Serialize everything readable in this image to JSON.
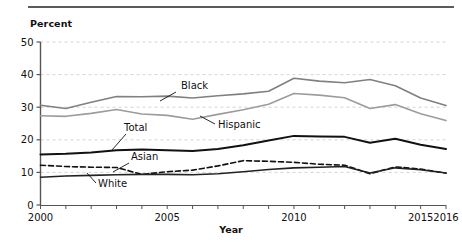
{
  "figure": {
    "y_axis_title": "Percent",
    "x_axis_title": "Year",
    "rule_color": "#5b5b5b"
  },
  "chart_data": {
    "type": "line",
    "title": "",
    "subtitle": "",
    "xlabel": "Year",
    "ylabel": "Percent",
    "xlim": [
      2000,
      2016
    ],
    "ylim": [
      0,
      50
    ],
    "ytick_labels": [
      "0",
      "10",
      "20",
      "30",
      "40",
      "50"
    ],
    "yticks": [
      0,
      10,
      20,
      30,
      40,
      50
    ],
    "xtick_labels": [
      "2000",
      "2005",
      "2010",
      "2015",
      "2016"
    ],
    "xticks": [
      2000,
      2005,
      2010,
      2015,
      2016
    ],
    "xtick_minor": [
      2001,
      2002,
      2003,
      2004,
      2006,
      2007,
      2008,
      2009,
      2011,
      2012,
      2013,
      2014
    ],
    "grid": "horizontal-dashed",
    "legend_position": "inline-annotations",
    "x": [
      2000,
      2001,
      2002,
      2003,
      2004,
      2005,
      2006,
      2007,
      2008,
      2009,
      2010,
      2011,
      2012,
      2013,
      2014,
      2015,
      2016
    ],
    "series": [
      {
        "name": "Black",
        "color": "#808080",
        "style": "solid",
        "width": 1.6,
        "label": "Black",
        "label_x": 181,
        "label_y": 89,
        "leader": [
          [
            176,
            92
          ],
          [
            160,
            101
          ]
        ],
        "values": [
          30.6,
          29.6,
          31.5,
          33.3,
          33.2,
          33.4,
          32.8,
          33.5,
          34.1,
          34.9,
          38.9,
          38.0,
          37.5,
          38.5,
          36.6,
          32.8,
          30.5
        ]
      },
      {
        "name": "Hispanic",
        "color": "#9c9c9c",
        "style": "solid",
        "width": 1.6,
        "label": "Hispanic",
        "label_x": 218,
        "label_y": 128,
        "leader": [
          [
            215,
            124
          ],
          [
            200,
            116
          ]
        ],
        "values": [
          27.4,
          27.2,
          28.1,
          29.3,
          27.9,
          27.5,
          26.3,
          27.8,
          29.2,
          30.9,
          34.2,
          33.7,
          32.9,
          29.6,
          30.8,
          28.0,
          25.9
        ]
      },
      {
        "name": "Total",
        "color": "#111111",
        "style": "solid",
        "width": 2.0,
        "label": "Total",
        "label_x": 124,
        "label_y": 131,
        "leader": [
          [
            126,
            134
          ],
          [
            112,
            150
          ]
        ],
        "values": [
          15.5,
          15.7,
          16.1,
          16.8,
          17.0,
          16.8,
          16.6,
          17.2,
          18.3,
          19.8,
          21.2,
          21.0,
          20.9,
          19.1,
          20.3,
          18.5,
          17.2
        ]
      },
      {
        "name": "Asian",
        "color": "#111111",
        "style": "dashed",
        "width": 1.6,
        "label": "Asian",
        "label_x": 131,
        "label_y": 160,
        "leader": [
          [
            129,
            163
          ],
          [
            113,
            172
          ]
        ],
        "values": [
          12.2,
          11.8,
          11.6,
          11.5,
          9.4,
          10.2,
          10.7,
          12.0,
          13.6,
          13.4,
          13.1,
          12.5,
          12.2,
          9.6,
          11.7,
          11.0,
          9.8
        ]
      },
      {
        "name": "White",
        "color": "#222222",
        "style": "solid",
        "width": 1.6,
        "label": "White",
        "label_x": 98,
        "label_y": 187,
        "leader": [
          [
            96,
            183
          ],
          [
            87,
            173
          ]
        ],
        "values": [
          8.5,
          8.9,
          9.1,
          9.3,
          9.4,
          9.4,
          9.3,
          9.6,
          10.2,
          10.9,
          11.4,
          11.6,
          11.8,
          9.8,
          11.4,
          10.8,
          9.8
        ]
      }
    ]
  }
}
